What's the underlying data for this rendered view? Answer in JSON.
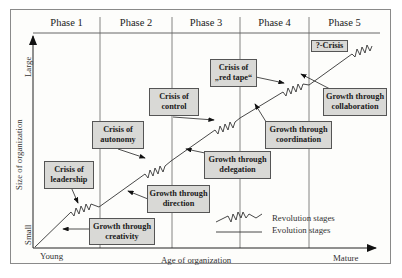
{
  "diagram": {
    "phases": [
      "Phase 1",
      "Phase 2",
      "Phase 3",
      "Phase 4",
      "Phase 5"
    ],
    "axes": {
      "x_label": "Age of organization",
      "x_start": "Young",
      "x_end": "Mature",
      "y_label": "Size of organization",
      "y_start": "Small",
      "y_end": "Large"
    },
    "crises": [
      {
        "line1": "Crisis of",
        "line2": "leadership"
      },
      {
        "line1": "Crisis of",
        "line2": "autonomy"
      },
      {
        "line1": "Crisis of",
        "line2": "control"
      },
      {
        "line1": "Crisis of",
        "line2": "„red tape“"
      },
      {
        "line1": "?-Crisis",
        "line2": ""
      }
    ],
    "growths": [
      {
        "line1": "Growth through",
        "line2": "creativity"
      },
      {
        "line1": "Growth through",
        "line2": "direction"
      },
      {
        "line1": "Growth through",
        "line2": "delegation"
      },
      {
        "line1": "Growth through",
        "line2": "coordination"
      },
      {
        "line1": "Growth through",
        "line2": "collaboration"
      }
    ],
    "legend": {
      "revolution": "Revolution stages",
      "evolution": "Evolution stages"
    },
    "colors": {
      "box_fill": "#d9d9d6",
      "box_border": "#555555",
      "line": "#333333",
      "background": "#fdfdfb"
    }
  }
}
